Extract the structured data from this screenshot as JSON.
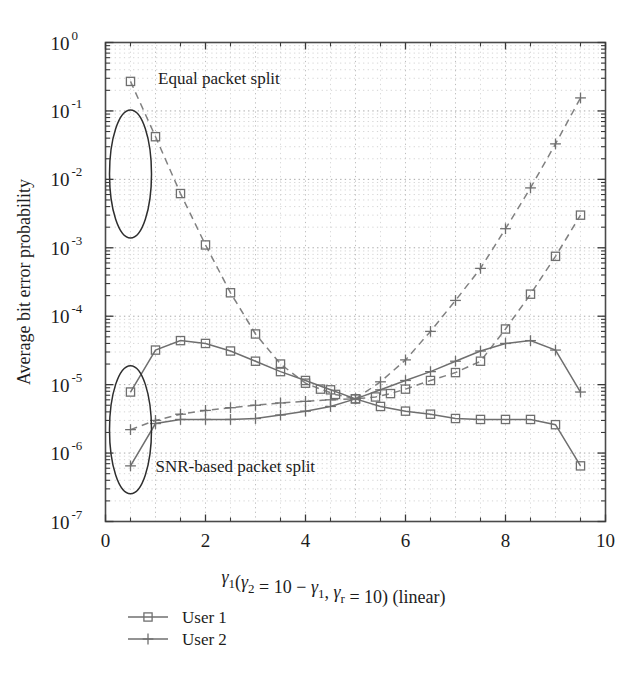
{
  "chart_data": {
    "type": "line",
    "title": "",
    "xlabel": "γ₁(γ₂ = 10 − γ₁, γᵣ = 10) (linear)",
    "ylabel": "Average bit error probability",
    "xlim": [
      0,
      10
    ],
    "ylim": [
      1e-07,
      1
    ],
    "xscale": "linear",
    "yscale": "log",
    "grid": true,
    "legend_position": "below-left",
    "xticks": [
      0,
      2,
      4,
      6,
      8,
      10
    ],
    "xticklabels": [
      "0",
      "2",
      "4",
      "6",
      "8",
      "10"
    ],
    "yticks": [
      1,
      0.1,
      0.01,
      0.001,
      0.0001,
      1e-05,
      1e-06,
      1e-07
    ],
    "yticklabels": [
      "10^0",
      "10^-1",
      "10^-2",
      "10^-3",
      "10^-4",
      "10^-5",
      "10^-6",
      "10^-7"
    ],
    "ytick_exponents": [
      "0",
      "-1",
      "-2",
      "-3",
      "-4",
      "-5",
      "-6",
      "-7"
    ],
    "ytick_mantissa": "10",
    "annotations": [
      {
        "text": "Equal packet split",
        "x": 1.05,
        "y": 0.3
      },
      {
        "text": "SNR-based packet split",
        "x": 1.0,
        "y": 6.5e-07
      }
    ],
    "ellipse_annotations": [
      {
        "cx": 0.5,
        "cy": 0.012,
        "label": "equal-split-group"
      },
      {
        "cx": 0.5,
        "cy": 2.2e-06,
        "label": "snr-split-group"
      }
    ],
    "series": [
      {
        "name": "User 1",
        "group": "Equal packet split",
        "marker": "square",
        "linestyle": "dashed",
        "x": [
          0.5,
          1.0,
          1.5,
          2.0,
          2.5,
          3.0,
          3.5,
          4.0,
          4.3,
          4.6,
          5.0,
          5.4,
          5.7,
          6.0,
          6.5,
          7.0,
          7.5,
          8.0,
          8.5,
          9.0,
          9.5
        ],
        "y": [
          0.27,
          0.042,
          0.0062,
          0.0011,
          0.00022,
          5.5e-05,
          2e-05,
          1.05e-05,
          8.6e-06,
          7.2e-06,
          6.2e-06,
          6.6e-06,
          7.4e-06,
          8.6e-06,
          1.15e-05,
          1.5e-05,
          2.2e-05,
          6.5e-05,
          0.00021,
          0.00075,
          0.003
        ]
      },
      {
        "name": "User 2",
        "group": "Equal packet split",
        "marker": "plus",
        "linestyle": "dashed",
        "x": [
          0.5,
          1.0,
          1.5,
          2.0,
          2.5,
          3.0,
          3.5,
          4.0,
          4.5,
          5.0,
          5.5,
          6.0,
          6.5,
          7.0,
          7.5,
          8.0,
          8.5,
          9.0,
          9.5
        ],
        "y": [
          2.2e-06,
          3e-06,
          3.7e-06,
          4.2e-06,
          4.6e-06,
          5e-06,
          5.4e-06,
          5.7e-06,
          6e-06,
          6.2e-06,
          1.1e-05,
          2.3e-05,
          6e-05,
          0.00017,
          0.0005,
          0.0019,
          0.0075,
          0.033,
          0.155
        ]
      },
      {
        "name": "User 1",
        "group": "SNR-based packet split",
        "marker": "square",
        "linestyle": "solid",
        "x": [
          0.5,
          1.0,
          1.5,
          2.0,
          2.5,
          3.0,
          3.5,
          4.0,
          4.5,
          5.0,
          5.5,
          6.0,
          6.5,
          7.0,
          7.5,
          8.0,
          8.5,
          9.0,
          9.5
        ],
        "y": [
          7.8e-06,
          3.2e-05,
          4.4e-05,
          4e-05,
          3.1e-05,
          2.2e-05,
          1.55e-05,
          1.15e-05,
          8.4e-06,
          6.2e-06,
          4.8e-06,
          4.1e-06,
          3.7e-06,
          3.2e-06,
          3.1e-06,
          3.1e-06,
          3.1e-06,
          2.6e-06,
          6.5e-07
        ]
      },
      {
        "name": "User 2",
        "group": "SNR-based packet split",
        "marker": "plus",
        "linestyle": "solid",
        "x": [
          0.5,
          1.0,
          1.5,
          2.0,
          2.5,
          3.0,
          3.5,
          4.0,
          4.5,
          5.0,
          5.5,
          6.0,
          6.5,
          7.0,
          7.5,
          8.0,
          8.5,
          9.0,
          9.5
        ],
        "y": [
          6.5e-07,
          2.7e-06,
          3.1e-06,
          3.1e-06,
          3.1e-06,
          3.2e-06,
          3.6e-06,
          4.1e-06,
          4.8e-06,
          6.2e-06,
          8.4e-06,
          1.15e-05,
          1.55e-05,
          2.2e-05,
          3.1e-05,
          4e-05,
          4.4e-05,
          3.2e-05,
          7.8e-06
        ]
      }
    ]
  },
  "legend": {
    "items": [
      {
        "label": "User 1",
        "marker": "square"
      },
      {
        "label": "User 2",
        "marker": "plus"
      }
    ]
  }
}
